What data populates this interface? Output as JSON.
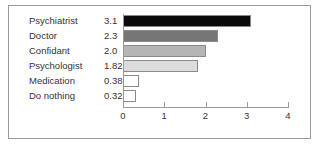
{
  "chart_data": {
    "type": "bar",
    "orientation": "horizontal",
    "title": "",
    "xlabel": "",
    "ylabel": "",
    "categories": [
      "Psychiatrist",
      "Doctor",
      "Confidant",
      "Psychologist",
      "Medication",
      "Do nothing"
    ],
    "values": [
      3.1,
      2.3,
      2.0,
      1.82,
      0.38,
      0.32
    ],
    "value_labels": [
      "3.1",
      "2.3",
      "2.0",
      "1.82",
      "0.38",
      "0.32"
    ],
    "bar_colors": [
      "#0a0a0a",
      "#767676",
      "#b5b5b5",
      "#dcdcdc",
      "#ffffff",
      "#ffffff"
    ],
    "bar_border_color": "#8a8a8a",
    "xlim": [
      0,
      4
    ],
    "xticks": [
      0,
      1,
      2,
      3,
      4
    ],
    "xtick_labels": [
      "0",
      "1",
      "2",
      "3",
      "4"
    ],
    "grid": false,
    "legend": null,
    "frame_color": "#9a9a9a",
    "axis_color": "#9a9a9a",
    "text_color": "#333333",
    "background": "#ffffff"
  }
}
